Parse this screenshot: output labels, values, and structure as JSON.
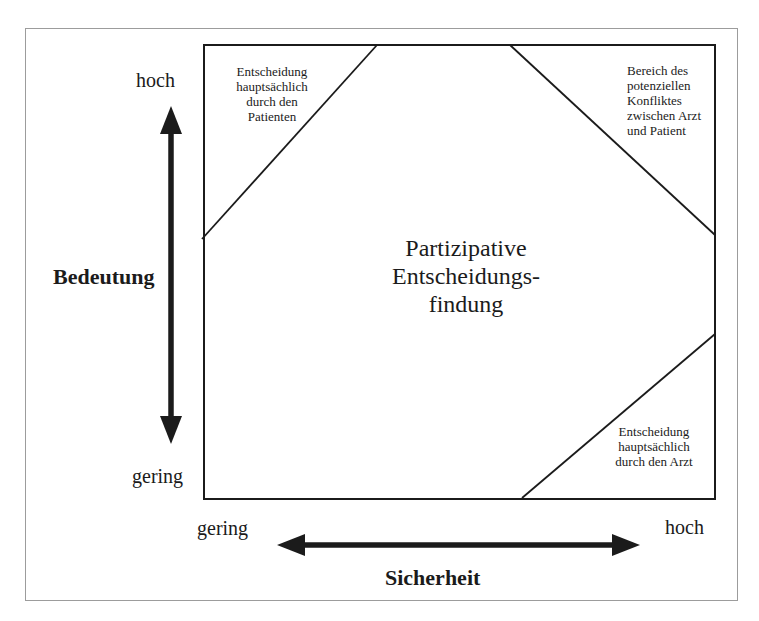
{
  "title": "Partizipative\nEntscheidungs-\nfindung",
  "regions": {
    "patient": "Entscheidung\nhauptsächlich\ndurch den\nPatienten",
    "conflict": "Bereich des\npotenziellen\nKonfliktes\nzwischen Arzt\nund Patient",
    "arzt": "Entscheidung\nhauptsächlich\ndurch den Arzt"
  },
  "axes": {
    "y": {
      "label": "Bedeutung",
      "high": "hoch",
      "low": "gering"
    },
    "x": {
      "label": "Sicherheit",
      "low": "gering",
      "high": "hoch"
    }
  },
  "colors": {
    "line": "#1b1b1b",
    "frame": "#9c9c9c",
    "background": "#ffffff"
  }
}
